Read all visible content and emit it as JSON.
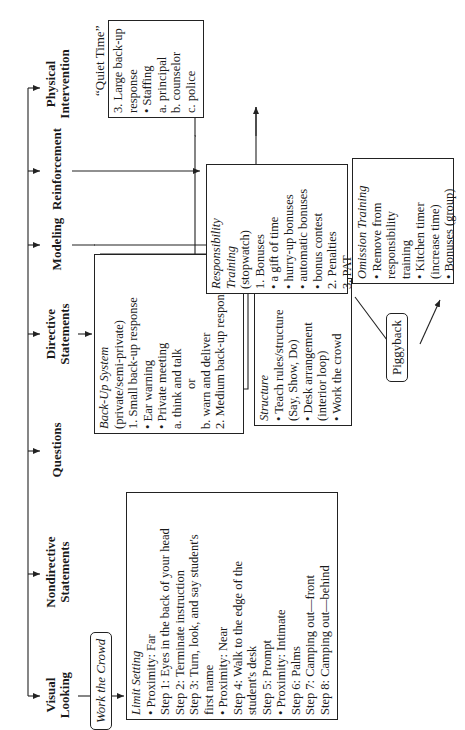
{
  "categories": [
    {
      "id": "visual-looking",
      "label_line1": "Visual",
      "label_line2": "Looking"
    },
    {
      "id": "nondirective-statements",
      "label_line1": "Nondirective",
      "label_line2": "Statements"
    },
    {
      "id": "questions",
      "label_line1": "Questions",
      "label_line2": ""
    },
    {
      "id": "directive-statements",
      "label_line1": "Directive",
      "label_line2": "Statements"
    },
    {
      "id": "modeling",
      "label_line1": "Modeling",
      "label_line2": ""
    },
    {
      "id": "reinforcement",
      "label_line1": "Reinforcement",
      "label_line2": ""
    },
    {
      "id": "physical-intervention",
      "label_line1": "Physical",
      "label_line2": "Intervention"
    }
  ],
  "work_the_crowd": "Work the Crowd",
  "limit_setting": {
    "title": "Limit Setting",
    "lines": [
      {
        "level": 0,
        "bullet": true,
        "text": "Proximity: Far"
      },
      {
        "level": 0,
        "bullet": false,
        "text": "Step 1: Eyes in the back of your head"
      },
      {
        "level": 0,
        "bullet": false,
        "text": "Step 2: Terminate instruction"
      },
      {
        "level": 0,
        "bullet": false,
        "text": "Step 3: Turn, look, and say student's"
      },
      {
        "level": 0,
        "bullet": false,
        "text": "first name"
      },
      {
        "level": 0,
        "bullet": true,
        "text": "Proximity: Near"
      },
      {
        "level": 0,
        "bullet": false,
        "text": "Step 4: Walk to the edge of the"
      },
      {
        "level": 1,
        "bullet": false,
        "text": "student's desk"
      },
      {
        "level": 0,
        "bullet": false,
        "text": "Step 5: Prompt"
      },
      {
        "level": 0,
        "bullet": true,
        "text": "Proximity: Intimate"
      },
      {
        "level": 0,
        "bullet": false,
        "text": "Step 6: Palms"
      },
      {
        "level": 0,
        "bullet": false,
        "text": "Step 7: Camping out—front"
      },
      {
        "level": 0,
        "bullet": false,
        "text": "Step 8: Camping out—behind"
      }
    ]
  },
  "back_up_system": {
    "title": "Back-Up System",
    "lines": [
      {
        "level": 0,
        "text": "(private/semi-private)"
      },
      {
        "level": 0,
        "text": "1. Small back-up response"
      },
      {
        "level": 1,
        "text": "• Ear warning"
      },
      {
        "level": 1,
        "text": "• Private meeting"
      },
      {
        "level": 2,
        "text": "a. think and talk"
      },
      {
        "level": 3,
        "text": "or"
      },
      {
        "level": 2,
        "text": "b. warn and deliver"
      },
      {
        "level": 0,
        "text": "2. Medium back-up response"
      }
    ]
  },
  "structure": {
    "title": "Structure",
    "lines": [
      {
        "level": 0,
        "text": "• Teach rules/structure"
      },
      {
        "level": 1,
        "text": "(Say, Show, Do)"
      },
      {
        "level": 0,
        "text": "• Desk arrangement"
      },
      {
        "level": 1,
        "text": "(interior loop)"
      },
      {
        "level": 0,
        "text": "• Work the crowd"
      }
    ]
  },
  "large_backup": {
    "lines": [
      {
        "level": 0,
        "text": "3. Large back-up"
      },
      {
        "level": 1,
        "text": "response"
      },
      {
        "level": 1,
        "text": "• Staffing"
      },
      {
        "level": 2,
        "text": "a. principal"
      },
      {
        "level": 2,
        "text": "b. counselor"
      },
      {
        "level": 2,
        "text": "c. police"
      }
    ]
  },
  "quiet_time": "“Quiet Time”",
  "responsibility_training": {
    "title_line1": "Responsibility",
    "title_line2": "Training",
    "lines": [
      {
        "level": 0,
        "text": "(stopwatch)"
      },
      {
        "level": 0,
        "text": "1. Bonuses"
      },
      {
        "level": 1,
        "text": "• a gift of time"
      },
      {
        "level": 1,
        "text": "• hurry-up bonuses"
      },
      {
        "level": 1,
        "text": "• automatic bonuses"
      },
      {
        "level": 1,
        "text": "• bonus contest"
      },
      {
        "level": 0,
        "text": "2. Penalties"
      },
      {
        "level": 0,
        "text": "3. PAT"
      }
    ]
  },
  "omission_training": {
    "title": "Omission Training",
    "lines": [
      {
        "level": 0,
        "text": "• Remove from"
      },
      {
        "level": 1,
        "text": "responsibility"
      },
      {
        "level": 1,
        "text": "training"
      },
      {
        "level": 0,
        "text": "• Kitchen timer"
      },
      {
        "level": 1,
        "text": "(increase time)"
      },
      {
        "level": 0,
        "text": "• Bonuses (group)"
      }
    ]
  },
  "piggyback": "Piggyback"
}
